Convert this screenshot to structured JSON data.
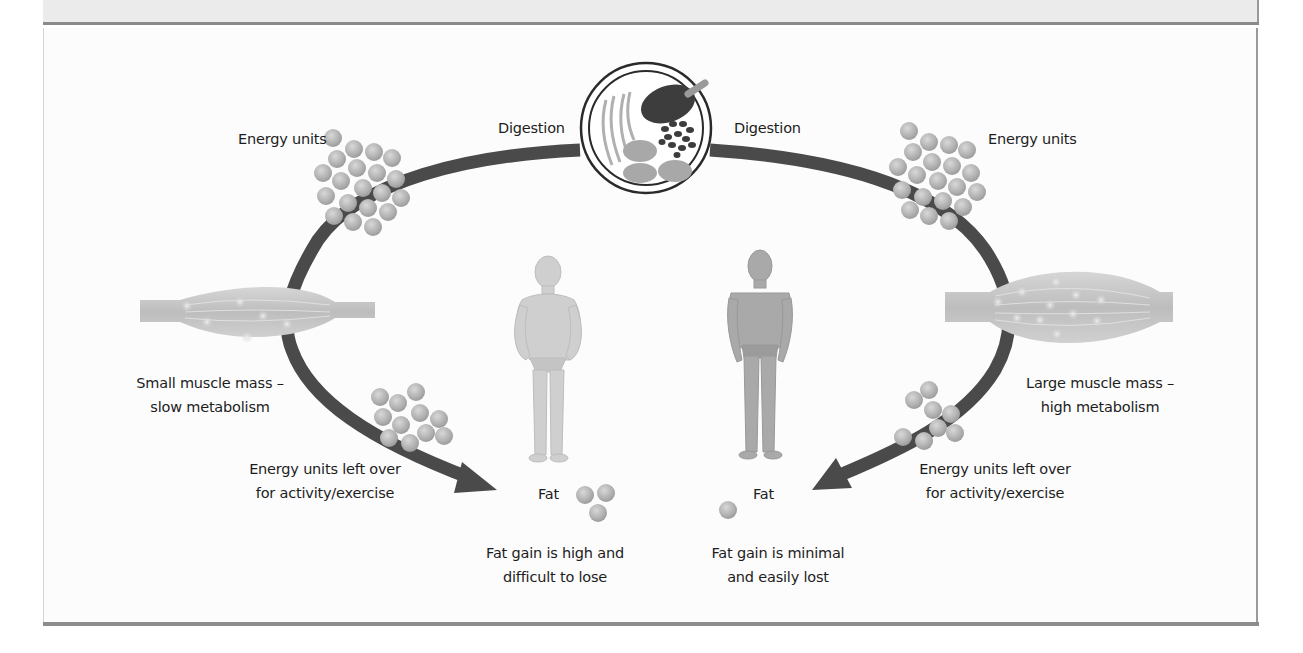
{
  "figure": {
    "type": "metabolism-comparison-diagram",
    "center": {
      "icon": "food-plate-icon",
      "left_label": "Digestion",
      "right_label": "Digestion"
    },
    "left_side": {
      "energy_label": "Energy units",
      "energy_unit_count": 20,
      "muscle_label_line1": "Small muscle mass –",
      "muscle_label_line2": "slow metabolism",
      "leftover_label_line1": "Energy units left over",
      "leftover_label_line2": "for activity/exercise",
      "leftover_unit_count": 11,
      "figure_icon": "overweight-person-icon",
      "fat_label": "Fat",
      "fat_unit_count": 3,
      "outcome_line1": "Fat gain is high and",
      "outcome_line2": "difficult to lose"
    },
    "right_side": {
      "energy_label": "Energy units",
      "energy_unit_count": 21,
      "muscle_label_line1": "Large muscle mass –",
      "muscle_label_line2": "high metabolism",
      "leftover_label_line1": "Energy units left over",
      "leftover_label_line2": "for activity/exercise",
      "leftover_unit_count": 8,
      "figure_icon": "muscular-person-icon",
      "fat_label": "Fat",
      "fat_unit_count": 1,
      "outcome_line1": "Fat gain is minimal",
      "outcome_line2": "and easily lost"
    },
    "colors": {
      "arc": "#4a4a4a",
      "energy_unit": "#b4b4b4",
      "muscle": "#c8c8c8",
      "panel_bg": "#fcfcfc",
      "top_strip": "#ebebeb",
      "rule": "#8a8a8a"
    }
  }
}
